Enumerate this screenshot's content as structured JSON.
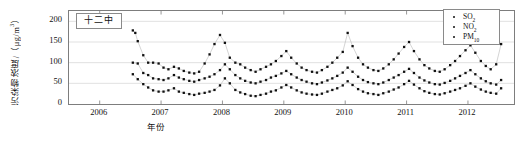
{
  "figure": {
    "panel_title": "十二中"
  },
  "chart_data": {
    "type": "line",
    "title": "十二中",
    "xlabel": "年份",
    "ylabel": "污染物浓度/（μg/m³）",
    "ylabel_main": "污染物浓度/（μg/m",
    "ylabel_exp": "3",
    "ylabel_tail": "）",
    "xlim": [
      2005.5,
      2012.75
    ],
    "ylim": [
      0,
      225
    ],
    "yticks": [
      0,
      50,
      100,
      150,
      200
    ],
    "xticks": [
      2006,
      2007,
      2008,
      2009,
      2010,
      2011,
      2012
    ],
    "xtick_labels": [
      "2006",
      "2007",
      "2008",
      "2009",
      "2010",
      "2011",
      "2012"
    ],
    "grid": "horizontal",
    "legend_position": "top-right",
    "marker": "filled-square",
    "series": [
      {
        "name": "SO2",
        "label_main": "SO",
        "label_sub": "2",
        "color": "#111111",
        "x": [
          2006.54,
          2006.62,
          2006.71,
          2006.79,
          2006.87,
          2006.96,
          2007.04,
          2007.12,
          2007.21,
          2007.29,
          2007.37,
          2007.46,
          2007.54,
          2007.62,
          2007.71,
          2007.79,
          2007.87,
          2007.96,
          2008.04,
          2008.12,
          2008.21,
          2008.29,
          2008.37,
          2008.46,
          2008.54,
          2008.62,
          2008.71,
          2008.79,
          2008.87,
          2008.96,
          2009.04,
          2009.12,
          2009.21,
          2009.29,
          2009.37,
          2009.46,
          2009.54,
          2009.62,
          2009.71,
          2009.79,
          2009.87,
          2009.96,
          2010.04,
          2010.12,
          2010.21,
          2010.29,
          2010.37,
          2010.46,
          2010.54,
          2010.62,
          2010.71,
          2010.79,
          2010.87,
          2010.96,
          2011.04,
          2011.12,
          2011.21,
          2011.29,
          2011.37,
          2011.46,
          2011.54,
          2011.62,
          2011.71,
          2011.79,
          2011.87,
          2011.96,
          2012.04,
          2012.12,
          2012.21,
          2012.29,
          2012.37,
          2012.46,
          2012.54
        ],
        "values": [
          72,
          60,
          48,
          40,
          33,
          30,
          30,
          33,
          38,
          30,
          27,
          24,
          22,
          25,
          27,
          30,
          34,
          45,
          62,
          50,
          34,
          28,
          24,
          20,
          19,
          22,
          25,
          30,
          33,
          40,
          46,
          40,
          33,
          28,
          25,
          23,
          22,
          25,
          30,
          34,
          38,
          45,
          55,
          46,
          36,
          30,
          26,
          24,
          22,
          26,
          30,
          35,
          40,
          48,
          56,
          47,
          38,
          31,
          27,
          24,
          23,
          26,
          30,
          34,
          38,
          44,
          50,
          42,
          35,
          30,
          27,
          25,
          38
        ]
      },
      {
        "name": "NO2",
        "label_main": "NO",
        "label_sub": "2",
        "color": "#111111",
        "x": [
          2006.54,
          2006.62,
          2006.71,
          2006.79,
          2006.87,
          2006.96,
          2007.04,
          2007.12,
          2007.21,
          2007.29,
          2007.37,
          2007.46,
          2007.54,
          2007.62,
          2007.71,
          2007.79,
          2007.87,
          2007.96,
          2008.04,
          2008.12,
          2008.21,
          2008.29,
          2008.37,
          2008.46,
          2008.54,
          2008.62,
          2008.71,
          2008.79,
          2008.87,
          2008.96,
          2009.04,
          2009.12,
          2009.21,
          2009.29,
          2009.37,
          2009.46,
          2009.54,
          2009.62,
          2009.71,
          2009.79,
          2009.87,
          2009.96,
          2010.04,
          2010.12,
          2010.21,
          2010.29,
          2010.37,
          2010.46,
          2010.54,
          2010.62,
          2010.71,
          2010.79,
          2010.87,
          2010.96,
          2011.04,
          2011.12,
          2011.21,
          2011.29,
          2011.37,
          2011.46,
          2011.54,
          2011.62,
          2011.71,
          2011.79,
          2011.87,
          2011.96,
          2012.04,
          2012.12,
          2012.21,
          2012.29,
          2012.37,
          2012.46,
          2012.54
        ],
        "values": [
          100,
          98,
          75,
          70,
          62,
          60,
          58,
          62,
          70,
          64,
          60,
          56,
          54,
          58,
          62,
          66,
          72,
          82,
          96,
          84,
          70,
          62,
          56,
          52,
          50,
          54,
          58,
          64,
          68,
          74,
          80,
          72,
          64,
          58,
          54,
          50,
          48,
          52,
          57,
          62,
          68,
          76,
          88,
          78,
          66,
          58,
          53,
          50,
          48,
          52,
          58,
          64,
          70,
          78,
          85,
          75,
          64,
          57,
          52,
          48,
          47,
          51,
          56,
          62,
          68,
          75,
          82,
          72,
          62,
          55,
          50,
          47,
          58
        ]
      },
      {
        "name": "PM10",
        "label_main": "PM",
        "label_sub": "10",
        "color": "#111111",
        "x": [
          2006.54,
          2006.58,
          2006.62,
          2006.71,
          2006.79,
          2006.87,
          2006.96,
          2007.04,
          2007.12,
          2007.21,
          2007.29,
          2007.37,
          2007.46,
          2007.54,
          2007.62,
          2007.71,
          2007.79,
          2007.87,
          2007.96,
          2008.04,
          2008.12,
          2008.21,
          2008.29,
          2008.37,
          2008.46,
          2008.54,
          2008.62,
          2008.71,
          2008.79,
          2008.87,
          2008.96,
          2009.04,
          2009.12,
          2009.21,
          2009.29,
          2009.37,
          2009.46,
          2009.54,
          2009.62,
          2009.71,
          2009.79,
          2009.87,
          2009.96,
          2010.04,
          2010.12,
          2010.21,
          2010.29,
          2010.37,
          2010.46,
          2010.54,
          2010.62,
          2010.71,
          2010.79,
          2010.87,
          2010.96,
          2011.04,
          2011.12,
          2011.21,
          2011.29,
          2011.37,
          2011.46,
          2011.54,
          2011.62,
          2011.71,
          2011.79,
          2011.87,
          2011.96,
          2012.04,
          2012.12,
          2012.21,
          2012.29,
          2012.37,
          2012.46,
          2012.54
        ],
        "values": [
          178,
          172,
          152,
          118,
          100,
          100,
          98,
          88,
          84,
          90,
          86,
          80,
          76,
          74,
          78,
          98,
          120,
          145,
          167,
          148,
          112,
          100,
          96,
          88,
          82,
          78,
          84,
          90,
          96,
          104,
          116,
          128,
          112,
          98,
          88,
          82,
          78,
          76,
          82,
          90,
          100,
          112,
          126,
          172,
          140,
          112,
          96,
          88,
          82,
          80,
          86,
          96,
          108,
          122,
          138,
          150,
          128,
          108,
          94,
          86,
          80,
          78,
          84,
          94,
          104,
          116,
          130,
          142,
          124,
          104,
          92,
          84,
          96,
          145
        ]
      }
    ]
  }
}
